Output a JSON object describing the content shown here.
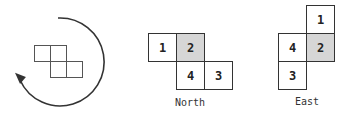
{
  "diagram": {
    "rotation_figure": {
      "icon": "rotate-clockwise-arrow-icon",
      "arrow_color": "#333333",
      "cells": [
        {
          "x": 34,
          "y": 45
        },
        {
          "x": 50,
          "y": 45
        },
        {
          "x": 50,
          "y": 61
        },
        {
          "x": 66,
          "y": 61
        }
      ]
    },
    "orientations": [
      {
        "label": "North",
        "cells": [
          {
            "num": "1",
            "highlight": false
          },
          {
            "num": "2",
            "highlight": true
          },
          {
            "num": "4",
            "highlight": false
          },
          {
            "num": "3",
            "highlight": false
          }
        ]
      },
      {
        "label": "East",
        "cells": [
          {
            "num": "1",
            "highlight": false
          },
          {
            "num": "4",
            "highlight": false
          },
          {
            "num": "2",
            "highlight": true
          },
          {
            "num": "3",
            "highlight": false
          }
        ]
      }
    ],
    "highlight_color": "#d6d6d6"
  }
}
